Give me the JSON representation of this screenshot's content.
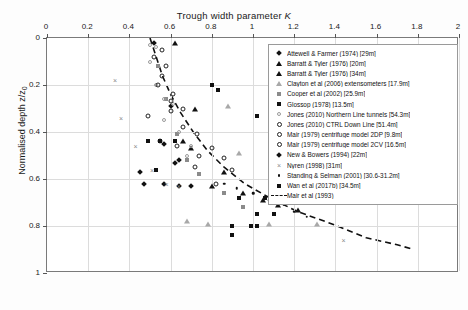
{
  "chart_data": {
    "type": "scatter",
    "title": "Trough width parameter K",
    "xlabel": "Trough width parameter K",
    "ylabel": "Normalised depth z/z0",
    "xlim": [
      0,
      2
    ],
    "ylim": [
      0,
      1
    ],
    "y_inverted": true,
    "grid": true,
    "x_axis_position": "top",
    "legend_position": "upper-right",
    "xticks": [
      "0",
      "0.2",
      "0.4",
      "0.6",
      "0.8",
      "1",
      "1.2",
      "1.4",
      "1.6",
      "1.8",
      "2"
    ],
    "xtick_values": [
      0,
      0.2,
      0.4,
      0.6,
      0.8,
      1,
      1.2,
      1.4,
      1.6,
      1.8,
      2
    ],
    "yticks": [
      "0",
      "0.2",
      "0.4",
      "0.6",
      "0.8",
      "1"
    ],
    "ytick_values": [
      0,
      0.2,
      0.4,
      0.6,
      0.8,
      1
    ],
    "series": [
      {
        "name": "Attewell & Farmer (1974) [29m]",
        "marker": "diamond-filled",
        "points": [
          [
            0.52,
            0.02
          ],
          [
            0.6,
            0.29
          ],
          [
            0.57,
            0.45
          ],
          [
            0.64,
            0.52
          ],
          [
            0.47,
            0.62
          ],
          [
            0.7,
            0.63
          ]
        ]
      },
      {
        "name": "Barratt & Tyler (1976) [20m]",
        "marker": "triangle-filled",
        "points": [
          [
            0.62,
            0.02
          ],
          [
            0.72,
            0.3
          ],
          [
            0.7,
            0.47
          ],
          [
            0.86,
            0.57
          ],
          [
            0.95,
            0.66
          ],
          [
            1.12,
            0.71
          ]
        ]
      },
      {
        "name": "Barratt & Tyler (1976) [34m]",
        "marker": "triangle-filled",
        "points": [
          [
            0.66,
            0.44
          ],
          [
            0.8,
            0.63
          ],
          [
            1.05,
            0.69
          ],
          [
            1.22,
            0.73
          ]
        ]
      },
      {
        "name": "Clayton et al (2006) extensometers [17.9m]",
        "marker": "triangle-grey",
        "points": [
          [
            0.88,
            0.29
          ],
          [
            0.93,
            0.49
          ],
          [
            1.16,
            0.55
          ],
          [
            0.68,
            0.78
          ],
          [
            0.78,
            0.79
          ],
          [
            1.08,
            0.79
          ],
          [
            1.31,
            0.79
          ]
        ]
      },
      {
        "name": "Cooper et al (2002) [25.9m]",
        "marker": "square-grey",
        "points": [
          [
            0.54,
            0.12
          ],
          [
            0.58,
            0.26
          ],
          [
            0.63,
            0.41
          ],
          [
            0.68,
            0.52
          ],
          [
            0.74,
            0.58
          ],
          [
            0.86,
            0.66
          ],
          [
            0.95,
            0.72
          ]
        ]
      },
      {
        "name": "Glossop (1978) [13.5m]",
        "marker": "square-filled",
        "points": [
          [
            0.83,
            0.22
          ],
          [
            0.49,
            0.44
          ],
          [
            0.55,
            0.44
          ],
          [
            0.62,
            0.44
          ],
          [
            0.53,
            0.56
          ],
          [
            0.93,
            0.68
          ],
          [
            1.06,
            0.68
          ],
          [
            0.9,
            0.8
          ],
          [
            0.99,
            0.8
          ],
          [
            0.9,
            0.84
          ]
        ]
      },
      {
        "name": "Jones (2010) Northern Line tunnels [54.3m]",
        "marker": "circle-grey",
        "points": [
          [
            0.5,
            0.03
          ],
          [
            0.53,
            0.04
          ],
          [
            0.5,
            0.1
          ],
          [
            0.53,
            0.2
          ],
          [
            0.57,
            0.26
          ],
          [
            0.61,
            0.28
          ],
          [
            0.57,
            0.35
          ],
          [
            0.64,
            0.4
          ],
          [
            0.7,
            0.46
          ],
          [
            0.68,
            0.5
          ]
        ]
      },
      {
        "name": "Jones (2010) CTRL Down Line [51.4m]",
        "marker": "circle-open",
        "points": [
          [
            0.56,
            0.05
          ],
          [
            0.6,
            0.27
          ],
          [
            0.66,
            0.3
          ],
          [
            0.73,
            0.41
          ],
          [
            0.8,
            0.47
          ],
          [
            0.86,
            0.51
          ],
          [
            0.9,
            0.56
          ],
          [
            1.1,
            0.37
          ],
          [
            1.18,
            0.47
          ],
          [
            1.25,
            0.58
          ],
          [
            1.32,
            0.59
          ]
        ]
      },
      {
        "name": "Mair (1979) centrifuge model 2DP [9.8m]",
        "marker": "circle-open",
        "points": [
          [
            0.52,
            0.08
          ],
          [
            0.56,
            0.16
          ],
          [
            0.61,
            0.24
          ],
          [
            0.49,
            0.33
          ],
          [
            0.63,
            0.46
          ],
          [
            0.72,
            0.55
          ]
        ]
      },
      {
        "name": "Mair (1979) centrifuge model 2CV [16.5m]",
        "marker": "circle-open",
        "points": [
          [
            0.58,
            0.12
          ],
          [
            0.54,
            0.2
          ],
          [
            0.6,
            0.31
          ],
          [
            0.66,
            0.38
          ],
          [
            0.74,
            0.5
          ],
          [
            0.82,
            0.62
          ]
        ]
      },
      {
        "name": "New & Bowers (1994) [22m]",
        "marker": "diamond-filled",
        "points": [
          [
            0.55,
            0.44
          ],
          [
            0.62,
            0.53
          ],
          [
            0.45,
            0.57
          ],
          [
            0.57,
            0.62
          ],
          [
            0.64,
            0.63
          ]
        ]
      },
      {
        "name": "Nyren (1998) [31m]",
        "marker": "x",
        "points": [
          [
            0.33,
            0.18
          ],
          [
            0.36,
            0.34
          ],
          [
            0.43,
            0.46
          ],
          [
            0.51,
            0.56
          ],
          [
            0.58,
            0.62
          ],
          [
            0.64,
            0.63
          ],
          [
            1.44,
            0.86
          ]
        ]
      },
      {
        "name": "Standing & Selman (2001) [30.6-31.2m]",
        "marker": "dot",
        "points": [
          [
            0.86,
            0.62
          ],
          [
            0.92,
            0.64
          ],
          [
            1.0,
            0.66
          ],
          [
            1.08,
            0.69
          ],
          [
            1.15,
            0.71
          ],
          [
            1.2,
            0.74
          ],
          [
            1.26,
            0.76
          ]
        ]
      },
      {
        "name": "Wan et al (2017b) [34.5m]",
        "marker": "square-filled",
        "points": [
          [
            0.8,
            0.2
          ],
          [
            1.02,
            0.33
          ],
          [
            1.18,
            0.44
          ],
          [
            1.22,
            0.56
          ],
          [
            1.1,
            0.61
          ],
          [
            1.02,
            0.75
          ],
          [
            1.1,
            0.75
          ],
          [
            1.02,
            0.8
          ]
        ]
      }
    ],
    "trend_line": {
      "name": "Mair et al (1993)",
      "style": "dashed",
      "color": "#111111",
      "points": [
        [
          0.5,
          0.0
        ],
        [
          0.53,
          0.08
        ],
        [
          0.56,
          0.16
        ],
        [
          0.6,
          0.24
        ],
        [
          0.65,
          0.32
        ],
        [
          0.71,
          0.4
        ],
        [
          0.78,
          0.48
        ],
        [
          0.86,
          0.55
        ],
        [
          0.96,
          0.62
        ],
        [
          1.08,
          0.68
        ],
        [
          1.22,
          0.74
        ],
        [
          1.38,
          0.79
        ],
        [
          1.55,
          0.85
        ],
        [
          1.7,
          0.88
        ],
        [
          1.78,
          0.9
        ]
      ]
    }
  },
  "legend": {
    "entries": [
      {
        "label": "Attewell & Farmer (1974) [29m]",
        "marker": "diamond-filled"
      },
      {
        "label": "Barratt & Tyler (1976) [20m]",
        "marker": "triangle-filled"
      },
      {
        "label": "Barratt & Tyler (1976) [34m]",
        "marker": "triangle-filled"
      },
      {
        "label": "Clayton et al (2006) extensometers [17.9m]",
        "marker": "triangle-grey"
      },
      {
        "label": "Cooper et al (2002) [25.9m]",
        "marker": "square-grey"
      },
      {
        "label": "Glossop (1978) [13.5m]",
        "marker": "square-filled"
      },
      {
        "label": "Jones (2010) Northern Line tunnels [54.3m]",
        "marker": "circle-grey"
      },
      {
        "label": "Jones (2010) CTRL Down Line [51.4m]",
        "marker": "circle-open"
      },
      {
        "label": "Mair (1979) centrifuge model 2DP [9.8m]",
        "marker": "circle-open"
      },
      {
        "label": "Mair (1979) centrifuge model 2CV [16.5m]",
        "marker": "circle-open"
      },
      {
        "label": "New & Bowers (1994) [22m]",
        "marker": "diamond-filled"
      },
      {
        "label": "Nyren (1998) [31m]",
        "marker": "x"
      },
      {
        "label": "Standing & Selman (2001) [30.6-31.2m]",
        "marker": "dot"
      },
      {
        "label": "Wan et al (2017b) [34.5m]",
        "marker": "square-filled"
      },
      {
        "label": "Mair et al (1993)",
        "marker": "dashed-line"
      }
    ]
  }
}
